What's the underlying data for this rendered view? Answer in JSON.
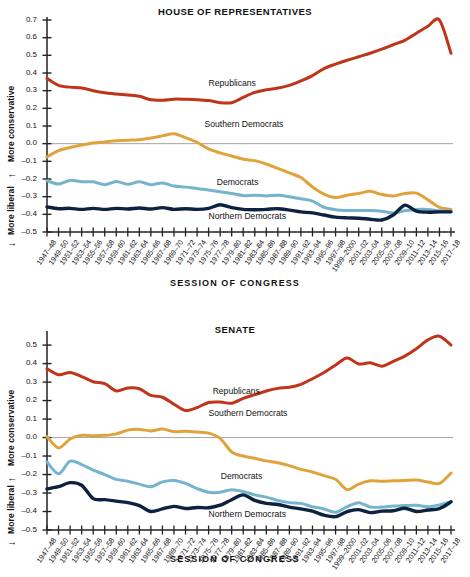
{
  "figure": {
    "xlabel": "SESSION OF CONGRESS",
    "ylabel_up": "More conservative",
    "ylabel_down": "More liberal",
    "arrow_up": "↑",
    "arrow_down": "↓",
    "colors": {
      "republicans": "#C0341A",
      "southern_democrats": "#E0A33C",
      "democrats": "#74B4CC",
      "northern_democrats": "#0D2140",
      "axis": "#222222",
      "zero_line": "#9a9a9a",
      "background": "#ffffff"
    }
  },
  "categories": [
    "1947–48",
    "1949–50",
    "1951–52",
    "1953–54",
    "1955–56",
    "1957–58",
    "1959–60",
    "1961–62",
    "1963–64",
    "1965–66",
    "1967–68",
    "1969–70",
    "1971–72",
    "1973–74",
    "1975–76",
    "1977–78",
    "1979–80",
    "1981–82",
    "1983–84",
    "1985–86",
    "1987–88",
    "1989–90",
    "1991–92",
    "1993–94",
    "1995–96",
    "1997–98",
    "1999–2000",
    "2001–02",
    "2003–04",
    "2005–06",
    "2007–08",
    "2009–10",
    "2011–12",
    "2013–14",
    "2015–16",
    "2017–18"
  ],
  "chart_data": [
    {
      "type": "line",
      "id": "house",
      "title": "HOUSE OF REPRESENTATIVES",
      "xlabel": "SESSION OF CONGRESS",
      "ylabel": "More conservative ↑ / ↓ More liberal",
      "ylim": [
        -0.5,
        0.7
      ],
      "yticks": [
        0.7,
        0.6,
        0.5,
        0.4,
        0.3,
        0.2,
        0.1,
        0.0,
        -0.1,
        -0.2,
        -0.3,
        -0.4,
        -0.5
      ],
      "ytick_labels": [
        "0.7",
        "0.6",
        "0.5",
        "0.4",
        "0.3",
        "0.2",
        "0.1",
        "0.0",
        "–0.1",
        "–0.2",
        "–0.3",
        "–0.4",
        "–0.5"
      ],
      "grid": false,
      "zero_line": true,
      "legend": "inline-labels",
      "categories": [
        "1947–48",
        "1949–50",
        "1951–52",
        "1953–54",
        "1955–56",
        "1957–58",
        "1959–60",
        "1961–62",
        "1963–64",
        "1965–66",
        "1967–68",
        "1969–70",
        "1971–72",
        "1973–74",
        "1975–76",
        "1977–78",
        "1979–80",
        "1981–82",
        "1983–84",
        "1985–86",
        "1987–88",
        "1989–90",
        "1991–92",
        "1993–94",
        "1995–96",
        "1997–98",
        "1999–2000",
        "2001–02",
        "2003–04",
        "2005–06",
        "2007–08",
        "2009–10",
        "2011–12",
        "2013–14",
        "2015–16",
        "2017–18"
      ],
      "series": [
        {
          "name": "Republicans",
          "color": "#C0341A",
          "label_x": 0.4,
          "label_y": 0.335,
          "values": [
            0.37,
            0.33,
            0.32,
            0.315,
            0.3,
            0.288,
            0.281,
            0.275,
            0.268,
            0.248,
            0.246,
            0.252,
            0.251,
            0.249,
            0.244,
            0.232,
            0.232,
            0.262,
            0.29,
            0.305,
            0.315,
            0.33,
            0.355,
            0.385,
            0.425,
            0.45,
            0.472,
            0.492,
            0.512,
            0.535,
            0.56,
            0.585,
            0.625,
            0.665,
            0.72,
            0.512
          ]
        },
        {
          "name": "Southern Democrats",
          "color": "#E0A33C",
          "label_x": 0.39,
          "label_y": 0.105,
          "values": [
            -0.075,
            -0.04,
            -0.022,
            -0.008,
            0.004,
            0.01,
            0.016,
            0.02,
            0.022,
            0.032,
            0.044,
            0.056,
            0.034,
            0.008,
            -0.03,
            -0.052,
            -0.07,
            -0.088,
            -0.096,
            -0.115,
            -0.14,
            -0.165,
            -0.192,
            -0.245,
            -0.285,
            -0.305,
            -0.292,
            -0.282,
            -0.27,
            -0.288,
            -0.296,
            -0.282,
            -0.28,
            -0.318,
            -0.36,
            -0.372
          ]
        },
        {
          "name": "Democrats",
          "color": "#74B4CC",
          "label_x": 0.42,
          "label_y": -0.225,
          "values": [
            -0.21,
            -0.228,
            -0.208,
            -0.215,
            -0.216,
            -0.232,
            -0.214,
            -0.23,
            -0.216,
            -0.232,
            -0.222,
            -0.24,
            -0.246,
            -0.254,
            -0.262,
            -0.272,
            -0.282,
            -0.294,
            -0.292,
            -0.296,
            -0.292,
            -0.3,
            -0.312,
            -0.325,
            -0.36,
            -0.374,
            -0.378,
            -0.378,
            -0.378,
            -0.382,
            -0.392,
            -0.38,
            -0.372,
            -0.372,
            -0.38,
            -0.382
          ]
        },
        {
          "name": "Northern Democrats",
          "color": "#0D2140",
          "label_x": 0.4,
          "label_y": -0.415,
          "values": [
            -0.358,
            -0.368,
            -0.366,
            -0.372,
            -0.366,
            -0.372,
            -0.366,
            -0.37,
            -0.364,
            -0.37,
            -0.362,
            -0.372,
            -0.368,
            -0.372,
            -0.366,
            -0.346,
            -0.362,
            -0.372,
            -0.374,
            -0.372,
            -0.368,
            -0.376,
            -0.386,
            -0.392,
            -0.404,
            -0.416,
            -0.42,
            -0.422,
            -0.428,
            -0.432,
            -0.404,
            -0.348,
            -0.382,
            -0.388,
            -0.386,
            -0.386
          ]
        }
      ]
    },
    {
      "type": "line",
      "id": "senate",
      "title": "SENATE",
      "xlabel": "SESSION OF CONGRESS",
      "ylabel": "More conservative ↑ / ↓ More liberal",
      "ylim": [
        -0.5,
        0.56
      ],
      "yticks": [
        0.5,
        0.4,
        0.3,
        0.2,
        0.1,
        0.0,
        -0.1,
        -0.2,
        -0.3,
        -0.4,
        -0.5
      ],
      "ytick_labels": [
        "0.5",
        "0.4",
        "0.3",
        "0.2",
        "0.1",
        "0.0",
        "–0.1",
        "–0.2",
        "–0.3",
        "–0.4",
        "–0.5"
      ],
      "grid": false,
      "zero_line": true,
      "legend": "inline-labels",
      "categories": [
        "1947–48",
        "1949–50",
        "1951–52",
        "1953–54",
        "1955–56",
        "1957–58",
        "1959–60",
        "1961–62",
        "1963–64",
        "1965–66",
        "1967–68",
        "1969–70",
        "1971–72",
        "1973–74",
        "1975–76",
        "1977–78",
        "1979–80",
        "1981–82",
        "1983–84",
        "1985–86",
        "1987–88",
        "1989–90",
        "1991–92",
        "1993–94",
        "1995–96",
        "1997–98",
        "1999–2000",
        "2001–02",
        "2003–04",
        "2005–06",
        "2007–08",
        "2009–10",
        "2011–12",
        "2013–14",
        "2015–16",
        "2017–18"
      ],
      "series": [
        {
          "name": "Republicans",
          "color": "#C0341A",
          "label_x": 0.41,
          "label_y": 0.245,
          "values": [
            0.372,
            0.34,
            0.352,
            0.33,
            0.302,
            0.292,
            0.252,
            0.268,
            0.264,
            0.228,
            0.218,
            0.18,
            0.146,
            0.162,
            0.19,
            0.192,
            0.186,
            0.212,
            0.232,
            0.252,
            0.266,
            0.272,
            0.288,
            0.318,
            0.352,
            0.392,
            0.43,
            0.398,
            0.404,
            0.386,
            0.412,
            0.44,
            0.48,
            0.528,
            0.548,
            0.5
          ]
        },
        {
          "name": "Southern Democrats",
          "color": "#E0A33C",
          "label_x": 0.4,
          "label_y": 0.125,
          "values": [
            0.005,
            -0.056,
            -0.008,
            0.012,
            0.01,
            0.012,
            0.02,
            0.04,
            0.044,
            0.036,
            0.046,
            0.032,
            0.034,
            0.03,
            0.024,
            -0.004,
            -0.078,
            -0.1,
            -0.112,
            -0.126,
            -0.136,
            -0.152,
            -0.172,
            -0.186,
            -0.206,
            -0.226,
            -0.282,
            -0.252,
            -0.234,
            -0.236,
            -0.234,
            -0.232,
            -0.23,
            -0.24,
            -0.248,
            -0.192
          ]
        },
        {
          "name": "Democrats",
          "color": "#74B4CC",
          "label_x": 0.43,
          "label_y": -0.215,
          "values": [
            -0.132,
            -0.196,
            -0.128,
            -0.146,
            -0.176,
            -0.2,
            -0.226,
            -0.236,
            -0.252,
            -0.266,
            -0.24,
            -0.232,
            -0.248,
            -0.276,
            -0.296,
            -0.296,
            -0.282,
            -0.292,
            -0.31,
            -0.322,
            -0.34,
            -0.352,
            -0.356,
            -0.374,
            -0.386,
            -0.404,
            -0.374,
            -0.352,
            -0.376,
            -0.376,
            -0.37,
            -0.368,
            -0.366,
            -0.374,
            -0.364,
            -0.346
          ]
        },
        {
          "name": "Northern Democrats",
          "color": "#0D2140",
          "label_x": 0.4,
          "label_y": -0.418,
          "values": [
            -0.278,
            -0.266,
            -0.244,
            -0.258,
            -0.33,
            -0.336,
            -0.344,
            -0.352,
            -0.368,
            -0.4,
            -0.386,
            -0.372,
            -0.384,
            -0.378,
            -0.38,
            -0.366,
            -0.336,
            -0.31,
            -0.34,
            -0.356,
            -0.362,
            -0.376,
            -0.386,
            -0.398,
            -0.42,
            -0.428,
            -0.4,
            -0.39,
            -0.406,
            -0.398,
            -0.396,
            -0.382,
            -0.4,
            -0.392,
            -0.384,
            -0.348
          ]
        }
      ]
    }
  ]
}
